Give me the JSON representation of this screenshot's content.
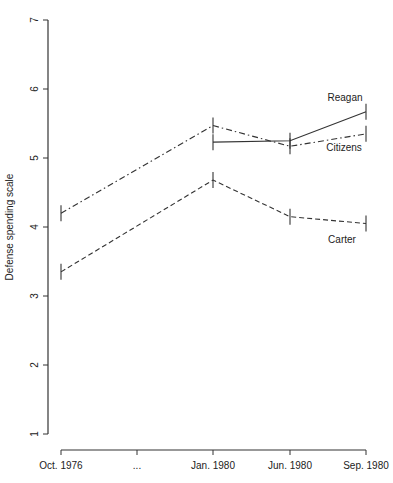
{
  "chart_data": {
    "type": "line",
    "title": "",
    "xlabel": "",
    "ylabel": "Defense spending scale",
    "ylim": [
      1,
      7
    ],
    "yticks": [
      "1",
      "2",
      "3",
      "4",
      "5",
      "6",
      "7"
    ],
    "categories": [
      "Oct. 1976",
      "...",
      "Jan. 1980",
      "Jun. 1980",
      "Sep. 1980"
    ],
    "grid": false,
    "legend": "direct labels",
    "series": [
      {
        "name": "Reagan",
        "style": "solid",
        "values": [
          null,
          null,
          5.23,
          5.25,
          5.67
        ]
      },
      {
        "name": "Citizens",
        "style": "dash-dot",
        "values": [
          4.2,
          null,
          5.47,
          5.17,
          5.35
        ]
      },
      {
        "name": "Carter",
        "style": "dashed",
        "values": [
          3.35,
          null,
          4.68,
          4.15,
          4.05
        ]
      }
    ]
  }
}
